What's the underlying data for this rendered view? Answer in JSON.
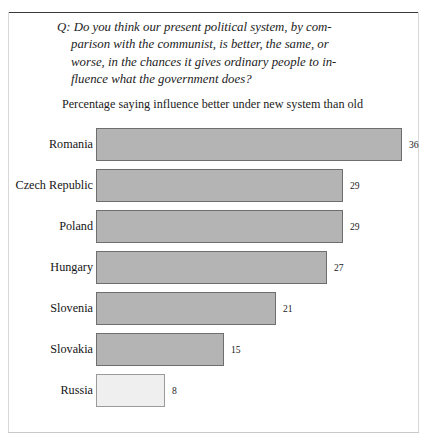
{
  "question": {
    "lines": [
      "Q: Do you think our present political system, by com-",
      "parison with the communist, is better, the same, or",
      "worse, in the chances it gives ordinary people to in-",
      "fluence what the government does?"
    ]
  },
  "subtitle": "Percentage saying influence better under new system than old",
  "chart_data": {
    "type": "bar",
    "orientation": "horizontal",
    "subtitle": "Percentage saying influence better under new system than old",
    "xlabel": "",
    "ylabel": "",
    "xlim": [
      0,
      36
    ],
    "grid": false,
    "legend": false,
    "categories": [
      "Romania",
      "Czech Republic",
      "Poland",
      "Hungary",
      "Slovenia",
      "Slovakia",
      "Russia"
    ],
    "values": [
      36,
      29,
      29,
      27,
      21,
      15,
      8
    ],
    "value_labels": [
      "36",
      "29",
      "29",
      "27",
      "21",
      "15",
      "8"
    ],
    "bar_colors": [
      "#b4b4b4",
      "#b4b4b4",
      "#b4b4b4",
      "#b4b4b4",
      "#b4b4b4",
      "#b4b4b4",
      "#efefef"
    ],
    "bar_border_color": "#6e6e6e"
  },
  "rows": [
    {
      "label": "Romania",
      "value": "36",
      "width": 306,
      "light": false
    },
    {
      "label": "Czech Republic",
      "value": "29",
      "width": 247,
      "light": false
    },
    {
      "label": "Poland",
      "value": "29",
      "width": 247,
      "light": false
    },
    {
      "label": "Hungary",
      "value": "27",
      "width": 231,
      "light": false
    },
    {
      "label": "Slovenia",
      "value": "21",
      "width": 180,
      "light": false
    },
    {
      "label": "Slovakia",
      "value": "15",
      "width": 128,
      "light": false
    },
    {
      "label": "Russia",
      "value": "8",
      "width": 69,
      "light": true
    }
  ]
}
